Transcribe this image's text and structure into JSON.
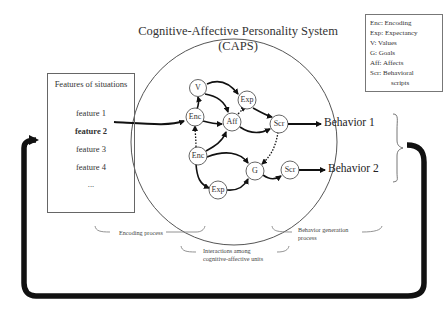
{
  "title": "Cognitive-Affective Personality System (CAPS)",
  "legend": {
    "items": [
      "Enc: Encoding",
      "Exp: Expectancy",
      "V:  Values",
      "G:  Goals",
      "Aff: Affects",
      "Scr: Behavioral",
      "scripts"
    ]
  },
  "features": {
    "header": "Features of situations",
    "items": [
      "feature 1",
      "feature 2",
      "feature 3",
      "feature 4",
      "..."
    ],
    "highlighted": "feature 2"
  },
  "nodes": {
    "v": "V",
    "exp_top": "Exp",
    "enc_top": "Enc",
    "aff": "Aff",
    "scr_top": "Scr",
    "enc_bottom": "Enc",
    "g": "G",
    "scr_bottom": "Scr",
    "exp_bottom": "Exp"
  },
  "behaviors": [
    "Behavior 1",
    "Behavior 2"
  ],
  "captions": {
    "encoding": "Encoding process",
    "interactions_line1": "Interactions among",
    "interactions_line2": "cognitive-affective units",
    "generation_line1": "Behavior generation",
    "generation_line2": "process"
  }
}
